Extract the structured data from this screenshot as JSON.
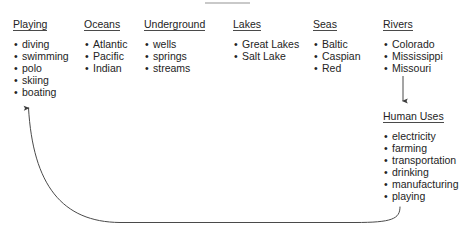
{
  "canvas": {
    "width": 463,
    "height": 232,
    "background": "#ffffff",
    "text_color": "#232323",
    "rule_color": "#c9c9c9",
    "line_color": "#4a4a4a"
  },
  "columns": [
    {
      "id": "playing",
      "heading": "Playing",
      "x": 13,
      "items": [
        "diving",
        "swimming",
        "polo",
        "skiing",
        "boating"
      ]
    },
    {
      "id": "oceans",
      "heading": "Oceans",
      "x": 84,
      "items": [
        "Atlantic",
        "Pacific",
        "Indian"
      ]
    },
    {
      "id": "underground",
      "heading": "Underground",
      "x": 144,
      "items": [
        "wells",
        "springs",
        "streams"
      ]
    },
    {
      "id": "lakes",
      "heading": "Lakes",
      "x": 233,
      "items": [
        "Great Lakes",
        "Salt Lake"
      ]
    },
    {
      "id": "seas",
      "heading": "Seas",
      "x": 313,
      "items": [
        "Baltic",
        "Caspian",
        "Red"
      ]
    },
    {
      "id": "rivers",
      "heading": "Rivers",
      "x": 383,
      "items": [
        "Colorado",
        "Mississippi",
        "Missouri"
      ]
    }
  ],
  "subgroup": {
    "id": "human-uses",
    "heading": "Human Uses",
    "x": 383,
    "y": 106,
    "items": [
      "electricity",
      "farming",
      "transportation",
      "drinking",
      "manufacturing",
      "playing"
    ]
  },
  "connectors": [
    {
      "id": "rivers-to-human-uses",
      "type": "straight-arrow",
      "from": "rivers",
      "to": "human-uses",
      "direction": "down"
    },
    {
      "id": "human-uses-playing-to-playing",
      "type": "curved-arrow",
      "from": "human-uses.playing",
      "to": "playing",
      "direction": "up-left"
    }
  ]
}
